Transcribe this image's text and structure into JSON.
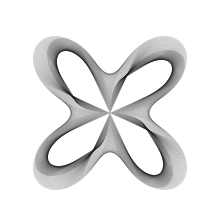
{
  "figure": {
    "background": "#ffffff",
    "stroke_color": "#1a1a1a",
    "stroke_opacity": 0.55,
    "stroke_width": 0.35,
    "center": [
      110,
      113
    ],
    "radius": 100,
    "petals": 4,
    "rotation_deg": 45,
    "line_count": 720,
    "phase_offset": 0.42,
    "band_scale": 0.55
  }
}
